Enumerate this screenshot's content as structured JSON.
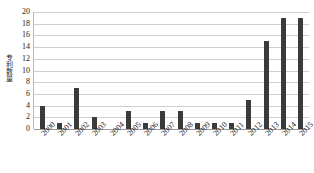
{
  "chart_data": {
    "type": "bar",
    "title": "",
    "xlabel": "",
    "ylabel": "专利数量",
    "categories": [
      "2000",
      "2001",
      "2002",
      "2003",
      "2004",
      "2005",
      "2006",
      "2007",
      "2008",
      "2009",
      "2010",
      "2011",
      "2012",
      "2013",
      "2014",
      "2015"
    ],
    "values": [
      4,
      1,
      7,
      2,
      0,
      3,
      1,
      3,
      3,
      1,
      1,
      1,
      5,
      15,
      19,
      19
    ],
    "ylim": [
      0,
      20
    ],
    "ytick_step": 2,
    "yticks": [
      "0",
      "2",
      "4",
      "6",
      "8",
      "10",
      "12",
      "14",
      "16",
      "18",
      "20"
    ],
    "grid": true,
    "legend": false,
    "bar_color": "#3b3b3b",
    "gridline_color": "#cfcfcf",
    "axis_color": "#9a9a9a",
    "xtick_rotation": -45
  }
}
